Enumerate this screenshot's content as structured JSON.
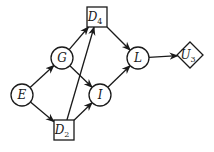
{
  "diagram": {
    "type": "influence-diagram",
    "nodes": [
      {
        "id": "E",
        "label": "E",
        "subscript": "",
        "shape": "circle"
      },
      {
        "id": "G",
        "label": "G",
        "subscript": "",
        "shape": "circle"
      },
      {
        "id": "I",
        "label": "I",
        "subscript": "",
        "shape": "circle"
      },
      {
        "id": "L",
        "label": "L",
        "subscript": "",
        "shape": "circle"
      },
      {
        "id": "D4",
        "label": "D",
        "subscript": "4",
        "shape": "square"
      },
      {
        "id": "D2",
        "label": "D",
        "subscript": "2",
        "shape": "square"
      },
      {
        "id": "U3",
        "label": "U",
        "subscript": "3",
        "shape": "diamond"
      }
    ],
    "edges": [
      {
        "from": "E",
        "to": "G"
      },
      {
        "from": "E",
        "to": "D2"
      },
      {
        "from": "G",
        "to": "D4"
      },
      {
        "from": "G",
        "to": "I"
      },
      {
        "from": "D2",
        "to": "I"
      },
      {
        "from": "D2",
        "to": "D4"
      },
      {
        "from": "D4",
        "to": "L"
      },
      {
        "from": "I",
        "to": "L"
      },
      {
        "from": "L",
        "to": "U3"
      }
    ]
  }
}
